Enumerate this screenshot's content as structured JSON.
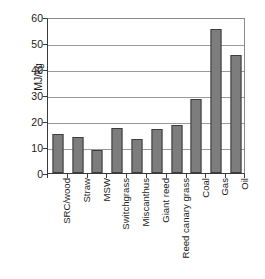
{
  "chart_data": {
    "type": "bar",
    "title": "",
    "subtitle": "",
    "xlabel": "",
    "ylabel": "MJ/kg",
    "ylim": [
      0,
      60
    ],
    "ytick_values": [
      0,
      10,
      20,
      30,
      40,
      50,
      60
    ],
    "ytick_labels": [
      "0",
      "10",
      "20",
      "30",
      "40",
      "50",
      "60"
    ],
    "grid": true,
    "legend": false,
    "legend_position": "none",
    "bar_color": "#7d7d7d",
    "bar_edge_color": "#3d3d3d",
    "categories": [
      "SRC/wood",
      "Straw",
      "MSW",
      "Switchgrass",
      "Miscanthus",
      "Giant reed",
      "Reed canary grass",
      "Coal",
      "Gas",
      "Oil"
    ],
    "values": [
      15.0,
      14.0,
      9.0,
      17.2,
      13.2,
      17.0,
      18.3,
      28.4,
      55.5,
      45.5
    ],
    "series": [
      {
        "name": "Energy content",
        "values": [
          15.0,
          14.0,
          9.0,
          17.2,
          13.2,
          17.0,
          18.3,
          28.4,
          55.5,
          45.5
        ]
      }
    ]
  }
}
